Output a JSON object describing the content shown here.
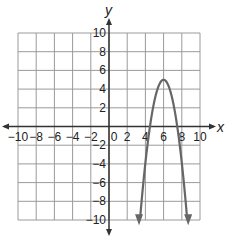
{
  "chart_data": {
    "type": "line",
    "title": "",
    "xlabel": "x",
    "ylabel": "y",
    "xlim": [
      -10,
      10
    ],
    "ylim": [
      -10,
      10
    ],
    "grid": true,
    "grid_step": 2,
    "x_ticks": [
      -10,
      -8,
      -6,
      -4,
      -2,
      0,
      2,
      4,
      6,
      8,
      10
    ],
    "x_tick_labels": [
      "−10",
      "−8",
      "−6",
      "−4",
      "−2",
      "0",
      "2",
      "4",
      "6",
      "8",
      "10"
    ],
    "y_ticks": [
      10,
      8,
      6,
      4,
      2,
      -2,
      -4,
      -6,
      -8,
      -10
    ],
    "y_tick_labels": [
      "10",
      "8",
      "6",
      "4",
      "2",
      "−2",
      "−4",
      "−6",
      "−8",
      "−10"
    ],
    "series": [
      {
        "name": "parabola",
        "equation": "y = -2.22(x - 6)^2 + 5",
        "vertex": [
          6,
          5
        ],
        "x_intercepts": [
          4.5,
          7.5
        ],
        "x_range": [
          3.3,
          8.7
        ],
        "arrows_at_ends": true,
        "color": "#666666"
      }
    ],
    "legend": null
  },
  "colors": {
    "grid": "#9a9a9a",
    "axis": "#333333",
    "curve": "#666666"
  }
}
